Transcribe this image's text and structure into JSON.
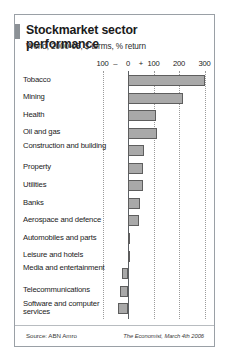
{
  "header": {
    "title": "Stockmarket sector performance",
    "subtitle": "World, 2000-05, $ terms, % return"
  },
  "footer": {
    "source": "Source: ABN Amro",
    "credit": "The Economist, March 4th 2006"
  },
  "chart_data": {
    "type": "bar",
    "orientation": "horizontal",
    "title": "Stockmarket sector performance",
    "subtitle": "World, 2000-05, $ terms, % return",
    "xlabel": "",
    "ylabel": "",
    "xlim": [
      -100,
      300
    ],
    "grid": true,
    "legend": null,
    "axis_ticks": [
      {
        "label": "100",
        "value": -100
      },
      {
        "label": "–",
        "value": -50
      },
      {
        "label": "0",
        "value": 0
      },
      {
        "label": "+",
        "value": 50
      },
      {
        "label": "100",
        "value": 100
      },
      {
        "label": "200",
        "value": 200
      },
      {
        "label": "300",
        "value": 300
      }
    ],
    "gridline_values": [
      -100,
      0,
      100,
      200,
      300
    ],
    "bar_color": "#a9a9a9",
    "bar_edge_color": "#5e5e5e",
    "categories": [
      "Tobacco",
      "Mining",
      "Health",
      "Oil and gas",
      "Construction and building",
      "Property",
      "Utilities",
      "Banks",
      "Aerospace and defence",
      "Automobiles and parts",
      "Leisure and hotels",
      "Media and entertainment",
      "Telecommunications",
      "Software and computer services"
    ],
    "values": [
      300,
      216,
      108,
      114,
      63,
      57,
      60,
      48,
      45,
      9,
      5,
      -23,
      -33,
      -41
    ]
  }
}
